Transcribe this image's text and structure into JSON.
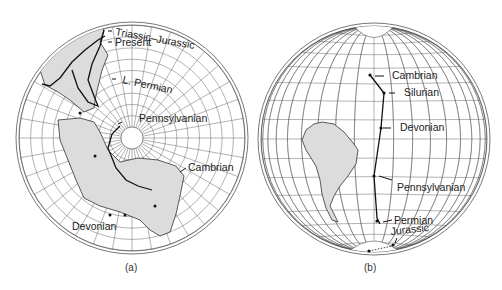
{
  "figure": {
    "panels": [
      {
        "id": "a",
        "caption": "(a)",
        "projection": "polar",
        "continents": [
          "North America / Europe (Laurasia)",
          "Gondwana"
        ],
        "labels": [
          {
            "text": "Triassic–Jurassic",
            "period": "Triassic-Jurassic"
          },
          {
            "text": "Present",
            "period": "Present"
          },
          {
            "text": "L. Permian",
            "period": "Late Permian"
          },
          {
            "text": "Pennsylvanian",
            "period": "Pennsylvanian"
          },
          {
            "text": "Cambrian",
            "period": "Cambrian"
          },
          {
            "text": "Devonian",
            "period": "Devonian"
          }
        ]
      },
      {
        "id": "b",
        "caption": "(b)",
        "projection": "equatorial",
        "continents": [
          "South America"
        ],
        "labels": [
          {
            "text": "Cambrian",
            "period": "Cambrian"
          },
          {
            "text": "Silurian",
            "period": "Silurian"
          },
          {
            "text": "Devonian",
            "period": "Devonian"
          },
          {
            "text": "Pennsylvanian",
            "period": "Pennsylvanian"
          },
          {
            "text": "Permian",
            "period": "Permian"
          },
          {
            "text": "Jurassic",
            "period": "Jurassic"
          }
        ]
      }
    ]
  }
}
